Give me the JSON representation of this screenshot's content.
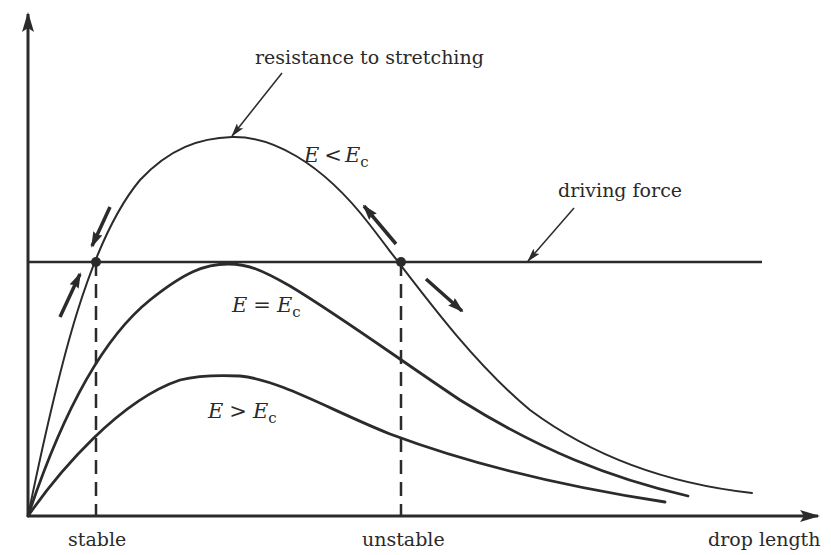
{
  "diagram": {
    "axes": {
      "x_label": "drop length",
      "y_label": "",
      "x_ticks": [
        "stable",
        "unstable"
      ]
    },
    "annotations": {
      "resistance": "resistance to stretching",
      "driving_force": "driving force"
    },
    "curves": [
      {
        "id": "below-critical",
        "label_main": "E",
        "label_rel": "<",
        "label_rhs": "E",
        "label_sub": "c"
      },
      {
        "id": "critical",
        "label_main": "E",
        "label_rel": "=",
        "label_rhs": "E",
        "label_sub": "c"
      },
      {
        "id": "above-critical",
        "label_main": "E",
        "label_rel": ">",
        "label_rhs": "E",
        "label_sub": "c"
      }
    ],
    "equilibrium_points": [
      {
        "name": "stable",
        "x_px": 96,
        "y_px": 262
      },
      {
        "name": "unstable",
        "x_px": 401,
        "y_px": 262
      }
    ],
    "colors": {
      "ink": "#2b2b2b",
      "background": "#ffffff"
    }
  }
}
